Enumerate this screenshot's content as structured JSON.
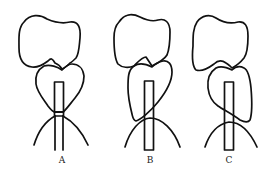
{
  "figure": {
    "panels": [
      {
        "label": "A",
        "label_x": 52
      },
      {
        "label": "B",
        "label_x": 140
      },
      {
        "label": "C",
        "label_x": 219
      }
    ],
    "colors": {
      "line": "#111111",
      "background": "#ffffff",
      "label": "#222222"
    }
  }
}
